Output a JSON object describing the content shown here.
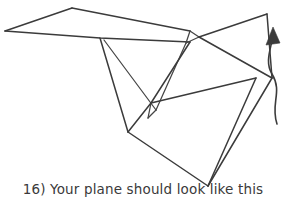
{
  "caption": {
    "step_number": "16)",
    "text": "16) Your plane should look like this",
    "body_text": "Your plane should look like this"
  },
  "figure": {
    "stroke_color": "#3b3b3b",
    "background_color": "#ffffff",
    "arrow": {
      "name": "curved-motion-arrow",
      "direction": "up",
      "path": "M 277 124 C 270 104 282 92 272 74 C 264 60 272 46 273 34",
      "head_points": "273,28 267,44 279,43"
    },
    "lines": [
      {
        "name": "left-wing-leading-edge",
        "points": "5,31 72,8"
      },
      {
        "name": "wing-top-edge-right",
        "points": "72,8 190,31"
      },
      {
        "name": "wing-trailing-edge",
        "points": "5,31 100,38 190,42"
      },
      {
        "name": "wing-notch-left",
        "points": "190,31 186,43"
      },
      {
        "name": "wing-notch-right",
        "points": "190,31 199,37"
      },
      {
        "name": "wing-notch-base",
        "points": "186,43 199,37"
      },
      {
        "name": "nose-to-top-right",
        "points": "199,37 267,14"
      },
      {
        "name": "right-wing-edge",
        "points": "267,14 272,78"
      },
      {
        "name": "right-wing-diagonal",
        "points": "199,37 272,78"
      },
      {
        "name": "right-lower-edge",
        "points": "272,78 208,186"
      },
      {
        "name": "fold-crease-left-a",
        "points": "100,38 128,132"
      },
      {
        "name": "fold-crease-left-b",
        "points": "105,40 156,110"
      },
      {
        "name": "v-notch-left",
        "points": "156,110 148,118"
      },
      {
        "name": "v-notch-right",
        "points": "148,118 150,104"
      },
      {
        "name": "inner-fold-upper",
        "points": "186,43 156,110"
      },
      {
        "name": "body-panel-top",
        "points": "152,104 190,42"
      },
      {
        "name": "body-panel-right",
        "points": "152,104 256,78"
      },
      {
        "name": "body-panel-left",
        "points": "128,132 152,104"
      },
      {
        "name": "body-panel-bottom",
        "points": "128,132 208,186"
      },
      {
        "name": "body-panel-diagonal",
        "points": "256,78 208,186"
      }
    ]
  }
}
